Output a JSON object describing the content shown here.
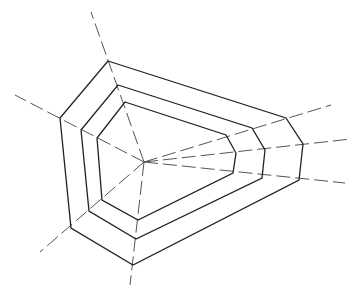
{
  "diagram": {
    "type": "radar-web",
    "center": [
      144,
      162
    ],
    "axes": [
      {
        "end": [
          91,
          12
        ]
      },
      {
        "end": [
          331,
          105
        ]
      },
      {
        "end": [
          351,
          139
        ]
      },
      {
        "end": [
          345,
          183
        ]
      },
      {
        "end": [
          130,
          285
        ]
      },
      {
        "end": [
          40,
          252
        ]
      },
      {
        "end": [
          15,
          95
        ]
      }
    ],
    "rings": [
      {
        "name": "outer",
        "points": [
          [
            108,
            61
          ],
          [
            286,
            118
          ],
          [
            303,
            144
          ],
          [
            299,
            180
          ],
          [
            133,
            265
          ],
          [
            71,
            228
          ],
          [
            60,
            118
          ]
        ]
      },
      {
        "name": "middle",
        "points": [
          [
            118,
            85
          ],
          [
            252,
            128
          ],
          [
            265,
            150
          ],
          [
            262,
            178
          ],
          [
            136,
            239
          ],
          [
            89,
            211
          ],
          [
            81,
            130
          ]
        ]
      },
      {
        "name": "inner",
        "points": [
          [
            125,
            102
          ],
          [
            226,
            135
          ],
          [
            236,
            153
          ],
          [
            233,
            173
          ],
          [
            138,
            220
          ],
          [
            102,
            200
          ],
          [
            97,
            138
          ]
        ]
      }
    ],
    "colors": {
      "line": "#222222",
      "axis": "#555555",
      "background": "#ffffff"
    }
  }
}
